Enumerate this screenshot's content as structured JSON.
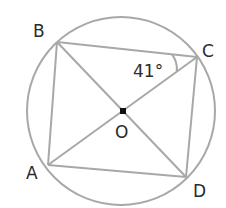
{
  "diagram": {
    "type": "geometry",
    "colors": {
      "line": "#a8a8a8",
      "text": "#2a2a2a",
      "center_dot": "#111111",
      "background": "#ffffff"
    },
    "circle": {
      "center": "O",
      "cx": 121,
      "cy": 111,
      "r": 94
    },
    "points": {
      "A": {
        "label": "A",
        "x": 48,
        "y": 165
      },
      "B": {
        "label": "B",
        "x": 57,
        "y": 42
      },
      "C": {
        "label": "C",
        "x": 197,
        "y": 57
      },
      "D": {
        "label": "D",
        "x": 186,
        "y": 177
      },
      "O": {
        "label": "O",
        "x": 123,
        "y": 111
      }
    },
    "segments": [
      "AB",
      "BC",
      "CD",
      "DA",
      "AC",
      "BD"
    ],
    "angle": {
      "vertex": "C",
      "between": [
        "CB",
        "CA"
      ],
      "label": "41°"
    }
  }
}
